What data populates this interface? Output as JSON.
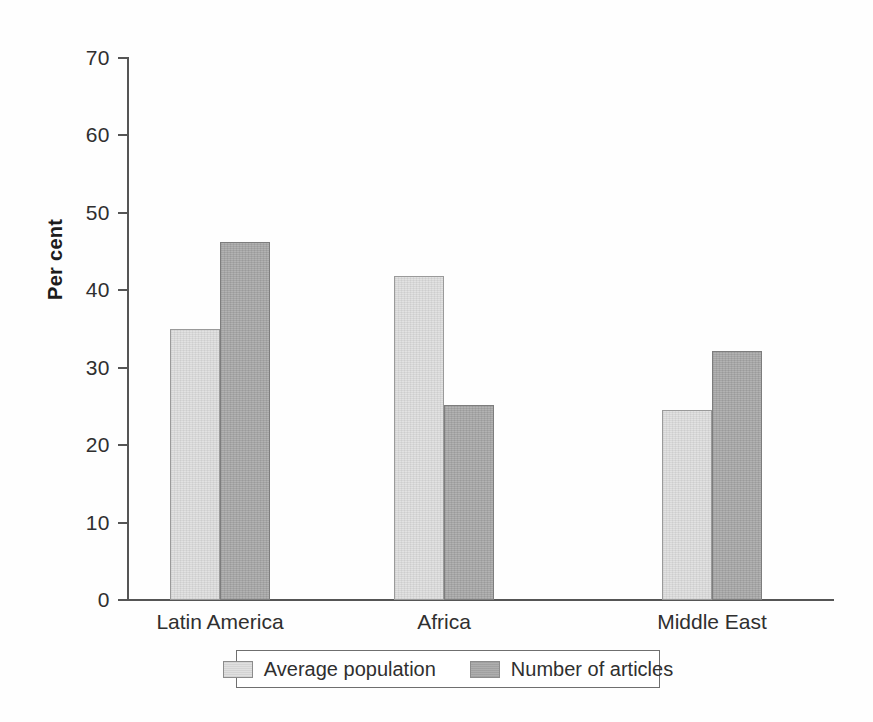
{
  "chart_data": {
    "type": "bar",
    "title": "",
    "subtitle": "",
    "xlabel": "",
    "ylabel": "Per cent",
    "categories": [
      "Latin America",
      "Africa",
      "Middle East"
    ],
    "series": [
      {
        "name": "Average population",
        "color": "#dedede",
        "values": [
          35.0,
          41.8,
          24.5
        ]
      },
      {
        "name": "Number of articles",
        "color": "#a9a9a9",
        "values": [
          46.3,
          25.2,
          32.2
        ]
      }
    ],
    "ylim": [
      0,
      70
    ],
    "ytick_values": [
      0,
      10,
      20,
      30,
      40,
      50,
      60,
      70
    ],
    "ytick_labels": [
      "0",
      "10",
      "20",
      "30",
      "40",
      "50",
      "60",
      "70"
    ],
    "grid": false,
    "legend_position": "bottom",
    "bars_adjacent": true,
    "axis_color": "#555555"
  },
  "axis": {
    "y_label": "Per cent",
    "ticks": [
      {
        "value": 70,
        "label": "70"
      },
      {
        "value": 60,
        "label": "60"
      },
      {
        "value": 50,
        "label": "50"
      },
      {
        "value": 40,
        "label": "40"
      },
      {
        "value": 30,
        "label": "30"
      },
      {
        "value": 20,
        "label": "20"
      },
      {
        "value": 10,
        "label": "10"
      },
      {
        "value": 0,
        "label": "0"
      }
    ]
  },
  "categories": [
    {
      "label": "Latin America"
    },
    {
      "label": "Africa"
    },
    {
      "label": "Middle East"
    }
  ],
  "legend": {
    "entries": [
      {
        "label": "Average population",
        "swatch": "light-gray-swatch"
      },
      {
        "label": "Number of articles",
        "swatch": "dark-gray-swatch"
      }
    ]
  }
}
